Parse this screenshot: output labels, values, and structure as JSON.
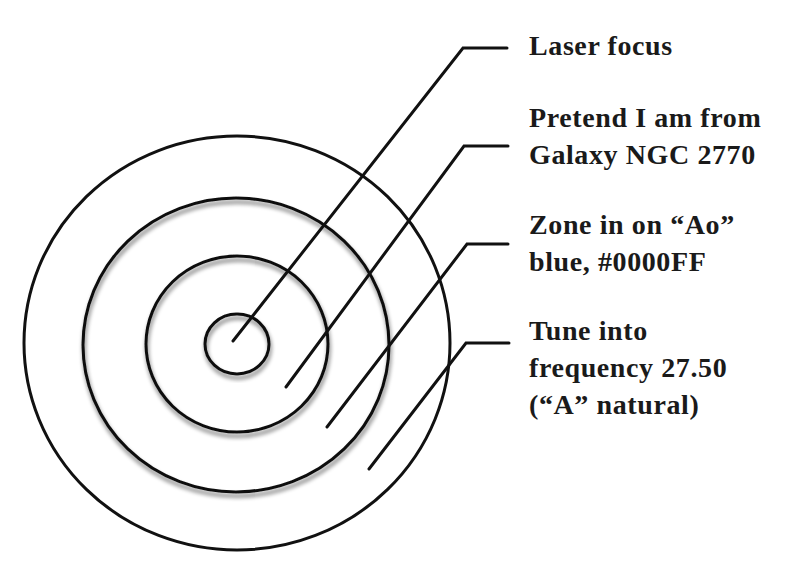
{
  "diagram": {
    "type": "concentric-target",
    "stroke_color": "#111111",
    "background_color": "#ffffff",
    "rings": [
      {
        "name": "outer",
        "cx": 237,
        "cy": 343,
        "rx": 213,
        "ry": 207
      },
      {
        "name": "second",
        "cx": 236,
        "cy": 345,
        "rx": 153,
        "ry": 147
      },
      {
        "name": "third",
        "cx": 237,
        "cy": 344,
        "rx": 91,
        "ry": 88
      },
      {
        "name": "inner",
        "cx": 237,
        "cy": 344,
        "rx": 32,
        "ry": 30
      }
    ],
    "labels": [
      {
        "id": "laser-focus",
        "lines": [
          "Laser focus"
        ]
      },
      {
        "id": "galaxy",
        "lines": [
          "Pretend I am from",
          "Galaxy NGC 2770"
        ]
      },
      {
        "id": "zone-blue",
        "lines": [
          "Zone in on “Ao”",
          "blue, #0000FF"
        ]
      },
      {
        "id": "tune-frequency",
        "lines": [
          "Tune into",
          "frequency 27.50",
          "(“A” natural)"
        ]
      }
    ]
  }
}
